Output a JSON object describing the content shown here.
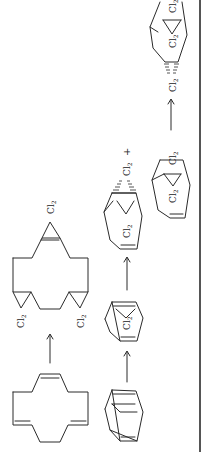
{
  "figure": {
    "orientation": "rotated-90-ccw",
    "line_color": "#2a2a2a",
    "background": "#ffffff"
  },
  "scheme_1": {
    "reactant": "cyclododecatriene",
    "arrow": "→",
    "product_labels": [
      "Cl2",
      "Cl2",
      "Cl2"
    ]
  },
  "scheme_2": {
    "reactant": "bicyclic diene",
    "step1_labels": [
      "Cl2"
    ],
    "step2_labels": [
      "Cl2",
      "Cl2"
    ],
    "plus": "+",
    "step2b_labels": [
      "Cl2",
      "Cl2"
    ],
    "step3_labels": [
      "Cl2",
      "Cl2",
      "Cl2"
    ],
    "arrows": [
      "→",
      "→",
      "→"
    ]
  },
  "labels": {
    "cl": "Cl",
    "sub": "2",
    "plus": "+"
  }
}
